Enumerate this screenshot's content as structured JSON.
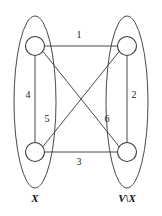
{
  "figure": {
    "background_color": "#ffffff",
    "stroke_color": "#4a4a4a",
    "node_fill_color": "#ffffff",
    "text_color": "#1c1c1c"
  },
  "sets": [
    {
      "id": "left-set",
      "label": "X",
      "label_x": 35,
      "label_y": 199,
      "ellipse": {
        "cx": 35,
        "cy": 102,
        "rx": 21,
        "ry": 86
      }
    },
    {
      "id": "right-set",
      "label": "V\\X",
      "label_x": 127,
      "label_y": 199,
      "ellipse": {
        "cx": 127,
        "cy": 102,
        "rx": 21,
        "ry": 86
      }
    }
  ],
  "nodes": [
    {
      "id": "node-top-left",
      "cx": 35,
      "cy": 46,
      "r": 9.5,
      "set": "left-set"
    },
    {
      "id": "node-top-right",
      "cx": 127,
      "cy": 46,
      "r": 9.5,
      "set": "right-set"
    },
    {
      "id": "node-bottom-left",
      "cx": 35,
      "cy": 152,
      "r": 9.5,
      "set": "left-set"
    },
    {
      "id": "node-bottom-right",
      "cx": 127,
      "cy": 152,
      "r": 9.5,
      "set": "right-set"
    }
  ],
  "edges": [
    {
      "id": "edge-1",
      "label": "1",
      "from": "node-top-left",
      "to": "node-top-right",
      "x1": 44.5,
      "y1": 46,
      "x2": 117.5,
      "y2": 46,
      "label_x": 79,
      "label_y": 36
    },
    {
      "id": "edge-2",
      "label": "2",
      "from": "node-top-right",
      "to": "node-bottom-right",
      "x1": 127,
      "y1": 55.5,
      "x2": 127,
      "y2": 142.5,
      "label_x": 134,
      "label_y": 96
    },
    {
      "id": "edge-3",
      "label": "3",
      "from": "node-bottom-left",
      "to": "node-bottom-right",
      "x1": 44.5,
      "y1": 152,
      "x2": 117.5,
      "y2": 152,
      "label_x": 79,
      "label_y": 163
    },
    {
      "id": "edge-4",
      "label": "4",
      "from": "node-top-left",
      "to": "node-bottom-left",
      "x1": 35,
      "y1": 55.5,
      "x2": 35,
      "y2": 142.5,
      "label_x": 28,
      "label_y": 96
    },
    {
      "id": "edge-5",
      "label": "5",
      "from": "node-top-left",
      "to": "node-bottom-right",
      "x1": 43,
      "y1": 51.5,
      "x2": 119.5,
      "y2": 147,
      "label_x": 47,
      "label_y": 120
    },
    {
      "id": "edge-6",
      "label": "6",
      "from": "node-bottom-left",
      "to": "node-top-right",
      "x1": 43,
      "y1": 146.5,
      "x2": 119.5,
      "y2": 51,
      "label_x": 107,
      "label_y": 120
    }
  ]
}
